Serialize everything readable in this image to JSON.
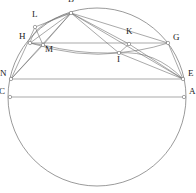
{
  "figure": {
    "background_color": "#ffffff",
    "stroke_color": "#6e6e6e",
    "label_color": "#1a1a1a",
    "node_fill": "#ffffff",
    "width": 196,
    "height": 193
  },
  "circle": {
    "name": "main-circle",
    "cx": 97,
    "cy": 97,
    "r": 89
  },
  "points": [
    {
      "id": "B",
      "label": "B",
      "x": 71,
      "y": 13,
      "label_dx": -3,
      "label_dy": -11
    },
    {
      "id": "L",
      "label": "L",
      "x": 35,
      "y": 27,
      "label_dx": -3,
      "label_dy": -10
    },
    {
      "id": "H",
      "label": "H",
      "x": 30,
      "y": 43,
      "label_dx": -11,
      "label_dy": -4
    },
    {
      "id": "M",
      "label": "M",
      "x": 43,
      "y": 45,
      "label_dx": 2,
      "label_dy": 7
    },
    {
      "id": "K",
      "label": "K",
      "x": 129,
      "y": 44,
      "label_dx": -3,
      "label_dy": -10
    },
    {
      "id": "G",
      "label": "G",
      "x": 168,
      "y": 43,
      "label_dx": 5,
      "label_dy": -3
    },
    {
      "id": "I",
      "label": "I",
      "x": 119,
      "y": 53,
      "label_dx": -2,
      "label_dy": 9
    },
    {
      "id": "N",
      "label": "N",
      "x": 11,
      "y": 79,
      "label_dx": -11,
      "label_dy": -3
    },
    {
      "id": "E",
      "label": "E",
      "x": 183,
      "y": 79,
      "label_dx": 5,
      "label_dy": -3
    },
    {
      "id": "C",
      "label": "C",
      "x": 10,
      "y": 97,
      "label_dx": -11,
      "label_dy": -3
    },
    {
      "id": "A",
      "label": "A",
      "x": 184,
      "y": 97,
      "label_dx": 5,
      "label_dy": -3
    }
  ],
  "segments": [
    {
      "name": "segment-H-G",
      "from": "H",
      "to": "G"
    },
    {
      "name": "segment-N-E",
      "from": "N",
      "to": "E"
    },
    {
      "name": "segment-C-A",
      "from": "C",
      "to": "A"
    },
    {
      "name": "segment-B-L",
      "from": "B",
      "to": "L"
    },
    {
      "name": "segment-B-H",
      "from": "B",
      "to": "H"
    },
    {
      "name": "segment-B-M",
      "from": "B",
      "to": "M"
    },
    {
      "name": "segment-B-I",
      "from": "B",
      "to": "I"
    },
    {
      "name": "segment-B-K",
      "from": "B",
      "to": "K"
    },
    {
      "name": "segment-B-E",
      "from": "B",
      "to": "E"
    },
    {
      "name": "segment-B-G",
      "from": "B",
      "to": "G"
    },
    {
      "name": "segment-N-B",
      "from": "N",
      "to": "B"
    },
    {
      "name": "segment-N-L",
      "from": "N",
      "to": "L"
    },
    {
      "name": "segment-N-M",
      "from": "N",
      "to": "M"
    },
    {
      "name": "segment-L-M",
      "from": "L",
      "to": "M"
    },
    {
      "name": "segment-H-M",
      "from": "H",
      "to": "M"
    },
    {
      "name": "segment-K-I",
      "from": "K",
      "to": "I"
    },
    {
      "name": "segment-I-E",
      "from": "I",
      "to": "E"
    },
    {
      "name": "segment-K-E",
      "from": "K",
      "to": "E"
    },
    {
      "name": "segment-G-E",
      "from": "G",
      "to": "E"
    }
  ],
  "arcs": [
    {
      "name": "arc-H-M-I-E",
      "d": "M 30 43 Q 78 58 119 53 Q 155 50 183 79"
    },
    {
      "name": "arc-H-L-B",
      "d": "M 30 43 Q 34 23 71 13"
    },
    {
      "name": "arc-M-G",
      "d": "M 43 45 Q 110 62 168 43"
    }
  ]
}
